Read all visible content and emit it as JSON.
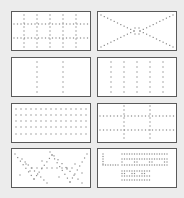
{
  "palette": {
    "title": "",
    "background": "#ececec",
    "tile_border": "#5a5a5a",
    "dot_color": "#8a8a8a",
    "tiles": [
      {
        "id": 1,
        "name": "grid-5-columns-2-rows",
        "pattern": "grid",
        "columns": 5,
        "rows": 2,
        "row": 1,
        "col": 1,
        "selected": false
      },
      {
        "id": 2,
        "name": "diagonal-x",
        "pattern": "x-diagonals",
        "row": 1,
        "col": 2,
        "selected": false
      },
      {
        "id": 3,
        "name": "two-vertical-lines",
        "pattern": "vertical-lines",
        "columns": 2,
        "row": 2,
        "col": 1,
        "selected": false
      },
      {
        "id": 4,
        "name": "five-vertical-lines",
        "pattern": "vertical-lines",
        "columns": 5,
        "row": 2,
        "col": 2,
        "selected": false
      },
      {
        "id": 5,
        "name": "dense-horizontal-rows",
        "pattern": "dot-rows",
        "rows": 5,
        "row": 3,
        "col": 1,
        "selected": false
      },
      {
        "id": 6,
        "name": "cross-grid-2x2",
        "pattern": "grid",
        "columns": 2,
        "rows": 2,
        "row": 3,
        "col": 2,
        "selected": false
      },
      {
        "id": 7,
        "name": "zigzag-scatter",
        "pattern": "zigzag",
        "row": 4,
        "col": 1,
        "selected": false
      },
      {
        "id": 8,
        "name": "text-dots",
        "pattern": "dotted-text",
        "row": 4,
        "col": 2,
        "selected": false
      }
    ]
  }
}
